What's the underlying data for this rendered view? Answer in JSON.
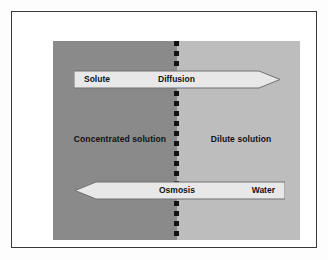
{
  "figure": {
    "background_color": "#fdfdfd",
    "frame_color": "#3a3a3a"
  },
  "panel": {
    "concentrated_side": {
      "label": "Concentrated solution",
      "color": "#8a8a8a"
    },
    "dilute_side": {
      "label": "Dilute solution",
      "color": "#bdbdbd"
    },
    "membrane": {
      "name": "semipermeable-membrane",
      "style": "dashed",
      "color": "#111111"
    }
  },
  "arrows": {
    "diffusion": {
      "process_label": "Diffusion",
      "particle_label": "Solute",
      "direction": "right",
      "fill_color": "#e8e8e8"
    },
    "osmosis": {
      "process_label": "Osmosis",
      "particle_label": "Water",
      "direction": "left",
      "fill_color": "#e8e8e8"
    }
  }
}
